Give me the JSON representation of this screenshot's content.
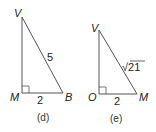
{
  "figures": [
    {
      "caption": "(d)",
      "vertices": {
        "top": "V",
        "right_angle": "M",
        "base_end": "B"
      },
      "hypotenuse_label": "5",
      "base_label": "2",
      "right_angle_at": "M"
    },
    {
      "caption": "(e)",
      "vertices": {
        "top": "V",
        "right_angle": "O",
        "base_end": "M"
      },
      "hypotenuse_label": "√21",
      "base_label": "2",
      "right_angle_at": "O"
    }
  ],
  "colors": {
    "line": "#555555",
    "text": "#222222"
  }
}
